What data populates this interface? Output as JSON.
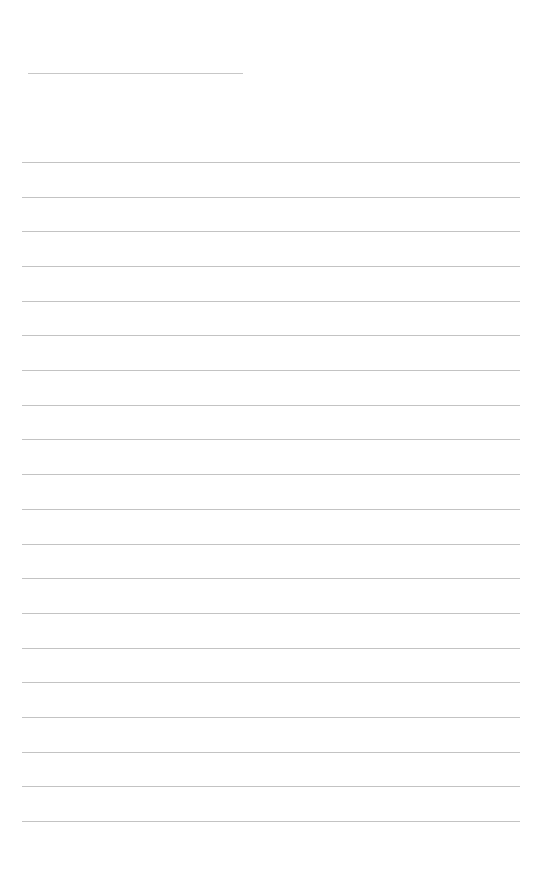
{
  "document": {
    "type": "lined-paper",
    "title_text": "",
    "ruled_line_count": 20,
    "line_color": "#b8b8b8",
    "background_color": "#ffffff"
  }
}
